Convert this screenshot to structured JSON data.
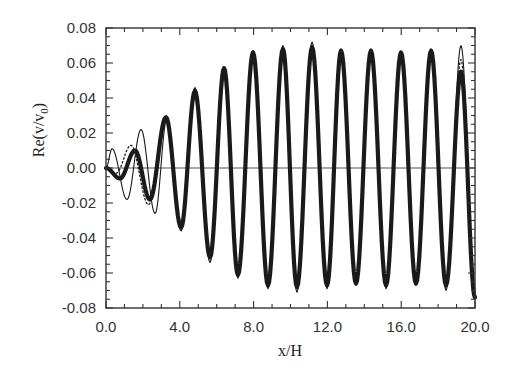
{
  "chart_data": {
    "type": "line",
    "title": "",
    "xlabel": "x/H",
    "ylabel": "Re(v/v0)",
    "ylabel_main": "Re(v/v",
    "ylabel_sub": "0",
    "ylabel_close": ")",
    "xlim": [
      0.0,
      20.0
    ],
    "ylim": [
      -0.08,
      0.08
    ],
    "x_ticks": [
      "0.0",
      "4.0",
      "8.0",
      "12.0",
      "16.0",
      "20.0"
    ],
    "x_tick_values": [
      0,
      4,
      8,
      12,
      16,
      20
    ],
    "y_ticks": [
      "0.08",
      "0.06",
      "0.04",
      "0.02",
      "0.00",
      "-0.02",
      "-0.04",
      "-0.06",
      "-0.08"
    ],
    "y_tick_values": [
      0.08,
      0.06,
      0.04,
      0.02,
      0.0,
      -0.02,
      -0.04,
      -0.06,
      -0.08
    ],
    "grid": false,
    "zero_line": true,
    "legend": null,
    "series": [
      {
        "name": "thick-solid",
        "style": "thick",
        "color": "#1a1a1a",
        "extrema": [
          [
            0.0,
            0.0
          ],
          [
            0.76,
            -0.006
          ],
          [
            1.57,
            0.01
          ],
          [
            2.38,
            -0.018
          ],
          [
            3.25,
            0.029
          ],
          [
            4.07,
            -0.034
          ],
          [
            4.82,
            0.044
          ],
          [
            5.64,
            -0.051
          ],
          [
            6.4,
            0.057
          ],
          [
            7.15,
            -0.061
          ],
          [
            7.97,
            0.066
          ],
          [
            8.78,
            -0.067
          ],
          [
            9.59,
            0.068
          ],
          [
            10.35,
            -0.068
          ],
          [
            11.17,
            0.069
          ],
          [
            11.98,
            -0.067
          ],
          [
            12.74,
            0.067
          ],
          [
            13.55,
            -0.066
          ],
          [
            14.36,
            0.067
          ],
          [
            15.18,
            -0.067
          ],
          [
            15.99,
            0.066
          ],
          [
            16.8,
            -0.066
          ],
          [
            17.62,
            0.067
          ],
          [
            18.43,
            -0.067
          ],
          [
            19.24,
            0.055
          ],
          [
            20.0,
            -0.074
          ]
        ]
      },
      {
        "name": "thin-solid",
        "style": "thin",
        "color": "#1a1a1a",
        "extrema": [
          [
            0.0,
            0.0
          ],
          [
            0.33,
            0.011
          ],
          [
            1.14,
            -0.018
          ],
          [
            1.9,
            0.022
          ],
          [
            2.66,
            -0.026
          ],
          [
            3.3,
            0.028
          ],
          [
            4.07,
            -0.036
          ],
          [
            4.82,
            0.046
          ],
          [
            5.64,
            -0.054
          ],
          [
            6.4,
            0.058
          ],
          [
            7.15,
            -0.063
          ],
          [
            7.97,
            0.067
          ],
          [
            8.78,
            -0.069
          ],
          [
            9.59,
            0.07
          ],
          [
            10.35,
            -0.071
          ],
          [
            11.17,
            0.072
          ],
          [
            11.98,
            -0.069
          ],
          [
            12.74,
            0.068
          ],
          [
            13.55,
            -0.067
          ],
          [
            14.36,
            0.068
          ],
          [
            15.18,
            -0.069
          ],
          [
            15.99,
            0.066
          ],
          [
            16.8,
            -0.067
          ],
          [
            17.62,
            0.068
          ],
          [
            18.43,
            -0.07
          ],
          [
            19.24,
            0.07
          ],
          [
            20.0,
            -0.072
          ]
        ]
      },
      {
        "name": "dotted",
        "style": "dotted",
        "color": "#1a1a1a",
        "extrema": [
          [
            0.0,
            0.0
          ],
          [
            0.55,
            -0.003
          ],
          [
            1.35,
            0.013
          ],
          [
            2.3,
            -0.021
          ],
          [
            3.25,
            0.028
          ],
          [
            4.07,
            -0.034
          ],
          [
            4.82,
            0.045
          ],
          [
            5.64,
            -0.052
          ],
          [
            6.4,
            0.057
          ],
          [
            7.15,
            -0.062
          ],
          [
            7.97,
            0.066
          ],
          [
            8.78,
            -0.068
          ],
          [
            9.59,
            0.069
          ],
          [
            10.35,
            -0.069
          ],
          [
            11.17,
            0.07
          ],
          [
            11.98,
            -0.068
          ],
          [
            12.74,
            0.067
          ],
          [
            13.55,
            -0.066
          ],
          [
            14.36,
            0.067
          ],
          [
            15.18,
            -0.068
          ],
          [
            15.99,
            0.066
          ],
          [
            16.8,
            -0.066
          ],
          [
            17.62,
            0.067
          ],
          [
            18.43,
            -0.068
          ],
          [
            19.24,
            0.062
          ],
          [
            20.0,
            -0.073
          ]
        ]
      }
    ]
  },
  "colors": {
    "axis": "#333333",
    "line": "#1a1a1a",
    "background": "#ffffff"
  }
}
